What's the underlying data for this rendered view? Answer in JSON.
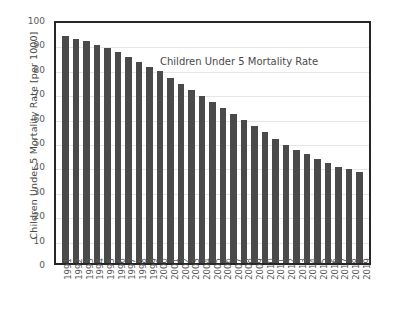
{
  "chart_data": {
    "type": "bar",
    "title": "Children Under 5 Mortality Rate",
    "xlabel": "",
    "ylabel": "Children Under 5 Mortality Rate [per 1000]",
    "ylim": [
      0,
      100
    ],
    "ytick_step": 10,
    "grid": true,
    "legend": "none",
    "bar_color": "#4a4a4a",
    "axis_color": "#262626",
    "gridline_color": "#e6e6e6",
    "title_position": "inside-plot-top-right",
    "categories": [
      "1991",
      "1992",
      "1993",
      "1994",
      "1995",
      "1996",
      "1997",
      "1998",
      "1999",
      "2000",
      "2001",
      "2002",
      "2003",
      "2004",
      "2005",
      "2006",
      "2007",
      "2008",
      "2009",
      "2010",
      "2011",
      "2012",
      "2013",
      "2014",
      "2015",
      "2016",
      "2017",
      "2018",
      "2019"
    ],
    "values": [
      93,
      92,
      91,
      89.5,
      88,
      86.5,
      84.5,
      82.5,
      80.5,
      78.5,
      76,
      73.5,
      71,
      68.5,
      66,
      63.5,
      61,
      58.5,
      56,
      53.5,
      51,
      48.5,
      46.5,
      44.5,
      42.5,
      41,
      39.5,
      38.5,
      37.5
    ],
    "ytick_labels": [
      "100",
      "90",
      "80",
      "70",
      "60",
      "50",
      "40",
      "30",
      "20",
      "10",
      "0"
    ],
    "ytick_values": [
      100,
      90,
      80,
      70,
      60,
      50,
      40,
      30,
      20,
      10,
      0
    ]
  }
}
